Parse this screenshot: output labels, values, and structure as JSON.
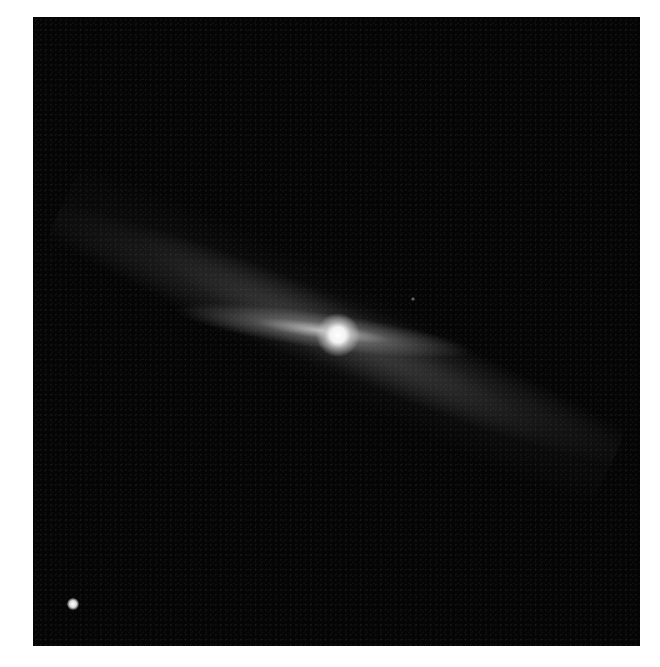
{
  "image": {
    "description": "Astronomical image of an edge-on disk with bright central source against dark sky",
    "background_color": "#050505",
    "page_color": "#ffffff"
  },
  "features": {
    "core": {
      "x": 305,
      "y": 318,
      "color": "#ffffff"
    },
    "point_source": {
      "x": 40,
      "y": 587,
      "color": "#e0e0e0"
    }
  }
}
